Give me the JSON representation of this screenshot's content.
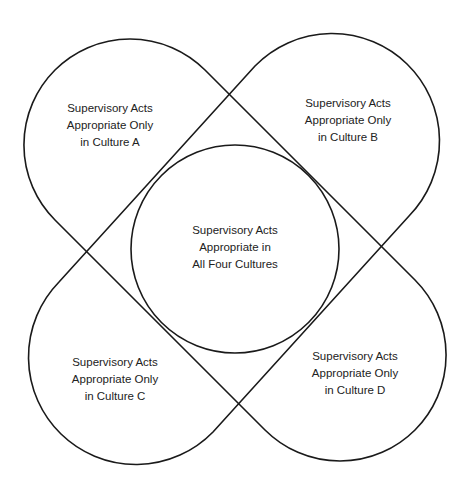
{
  "diagram": {
    "type": "overlapping-region diagram",
    "stroke_color": "#1a1a1a",
    "background": "#ffffff",
    "regions": [
      {
        "id": "culture-a",
        "lines": [
          "Supervisory Acts",
          "Appropriate Only",
          "in Culture A"
        ]
      },
      {
        "id": "culture-b",
        "lines": [
          "Supervisory Acts",
          "Appropriate Only",
          "in Culture B"
        ]
      },
      {
        "id": "all-four",
        "lines": [
          "Supervisory Acts",
          "Appropriate in",
          "All Four Cultures"
        ]
      },
      {
        "id": "culture-c",
        "lines": [
          "Supervisory Acts",
          "Appropriate Only",
          "in Culture C"
        ]
      },
      {
        "id": "culture-d",
        "lines": [
          "Supervisory Acts",
          "Appropriate Only",
          "in Culture D"
        ]
      }
    ]
  }
}
